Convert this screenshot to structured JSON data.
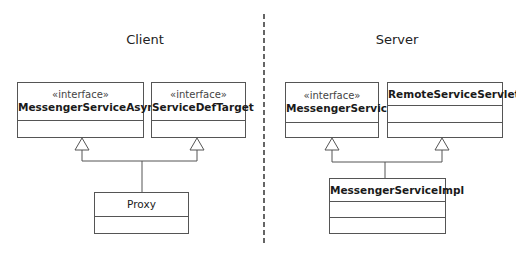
{
  "sections": {
    "client": {
      "title": "Client"
    },
    "server": {
      "title": "Server"
    }
  },
  "classes": {
    "messenger_service_async": {
      "stereotype": "«interface»",
      "name": "MessengerServiceAsync"
    },
    "service_def_target": {
      "stereotype": "«interface»",
      "name": "ServiceDefTarget"
    },
    "proxy": {
      "name": "Proxy"
    },
    "messenger_service": {
      "stereotype": "«interface»",
      "name": "MessengerService"
    },
    "remote_service_servlet": {
      "name": "RemoteServiceServlet"
    },
    "messenger_service_impl": {
      "name": "MessengerServiceImpl"
    }
  },
  "relationships": [
    {
      "from": "Proxy",
      "to": "MessengerServiceAsync",
      "type": "realization"
    },
    {
      "from": "Proxy",
      "to": "ServiceDefTarget",
      "type": "realization"
    },
    {
      "from": "MessengerServiceImpl",
      "to": "MessengerService",
      "type": "realization"
    },
    {
      "from": "MessengerServiceImpl",
      "to": "RemoteServiceServlet",
      "type": "generalization"
    }
  ],
  "colors": {
    "line": "#555555",
    "divider": "#333333",
    "background": "#ffffff"
  }
}
